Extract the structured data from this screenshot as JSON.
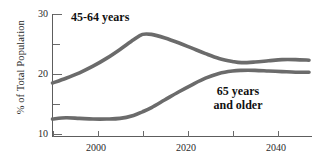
{
  "chart_data": {
    "type": "line",
    "title": "",
    "xlabel": "",
    "ylabel": "% of Total Population",
    "xlim": [
      1990,
      2047
    ],
    "ylim": [
      10,
      30
    ],
    "grid": false,
    "legend_position": "inline-annotation",
    "y_ticks": [
      {
        "value": 30,
        "label": "30",
        "major": true
      },
      {
        "value": 25,
        "label": "",
        "major": false
      },
      {
        "value": 20,
        "label": "20",
        "major": true
      },
      {
        "value": 15,
        "label": "",
        "major": false
      },
      {
        "value": 10,
        "label": "10",
        "major": true
      }
    ],
    "x_ticks": [
      {
        "value": 1990,
        "label": ""
      },
      {
        "value": 2000,
        "label": "2000"
      },
      {
        "value": 2010,
        "label": ""
      },
      {
        "value": 2020,
        "label": "2020"
      },
      {
        "value": 2030,
        "label": ""
      },
      {
        "value": 2040,
        "label": "2040"
      }
    ],
    "series_color": "#6b6b6b",
    "series": [
      {
        "name": "45-64 years",
        "annotation": "45-64 years",
        "x": [
          1990,
          1993,
          1996,
          1999,
          2002,
          2005,
          2008,
          2010,
          2012,
          2015,
          2018,
          2021,
          2024,
          2027,
          2030,
          2032,
          2035,
          2038,
          2041,
          2044,
          2047
        ],
        "values": [
          18.5,
          19.3,
          20.2,
          21.3,
          22.6,
          24.1,
          25.7,
          26.6,
          26.6,
          26.0,
          25.2,
          24.3,
          23.4,
          22.6,
          22.1,
          21.9,
          22.0,
          22.2,
          22.4,
          22.4,
          22.3
        ]
      },
      {
        "name": "65 years and older",
        "annotation_line1": "65 years",
        "annotation_line2": "and older",
        "x": [
          1990,
          1993,
          1996,
          1999,
          2002,
          2005,
          2008,
          2010,
          2012,
          2015,
          2018,
          2021,
          2024,
          2027,
          2030,
          2032,
          2035,
          2038,
          2041,
          2044,
          2047
        ],
        "values": [
          12.5,
          12.7,
          12.6,
          12.5,
          12.5,
          12.6,
          13.1,
          13.7,
          14.4,
          15.7,
          17.0,
          18.2,
          19.3,
          20.1,
          20.5,
          20.6,
          20.6,
          20.5,
          20.4,
          20.3,
          20.3
        ]
      }
    ]
  },
  "labels": {
    "y_axis_title": "% of Total Population",
    "series_1_annotation": "45-64 years",
    "series_2_annotation_line1": "65 years",
    "series_2_annotation_line2": "and older",
    "ytick_30": "30",
    "ytick_20": "20",
    "ytick_10": "10",
    "xtick_2000": "2000",
    "xtick_2020": "2020",
    "xtick_2040": "2040"
  }
}
